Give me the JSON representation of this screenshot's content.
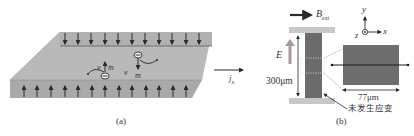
{
  "panel_a": {
    "caption": "(a)",
    "current_label": "j",
    "current_sub": "x",
    "spin_label_1": "m",
    "spin_label_2": "m",
    "velocity_label_1": "v",
    "velocity_label_2": "v",
    "colors": {
      "slab_top": "#b9b9b9",
      "slab_edge": "#a8a8a8",
      "arrow": "#2a2a2a"
    }
  },
  "panel_b": {
    "caption": "(b)",
    "field_label": "B",
    "field_sub": "ext",
    "efield_label": "E",
    "height_label": "300μm",
    "width_label": "77μm",
    "annotation": "未发生应变",
    "axes": {
      "x": "x",
      "y": "y",
      "z": "z"
    },
    "colors": {
      "sample": "#6b6b6b",
      "electrode": "#c8c8c8",
      "e_arrow": "#a89a96"
    }
  }
}
